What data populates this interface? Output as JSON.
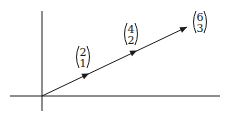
{
  "diagram": {
    "axes": {
      "color": "#1a1a1a"
    },
    "vector_color": "#1a1a1a",
    "vectors": [
      {
        "top": "2",
        "bottom": "1"
      },
      {
        "top": "4",
        "bottom": "2"
      },
      {
        "top": "6",
        "bottom": "3"
      }
    ]
  }
}
